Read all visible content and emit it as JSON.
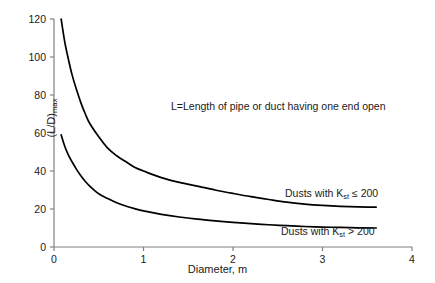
{
  "chart_data": {
    "type": "line",
    "title": "",
    "xlabel": "Diameter, m",
    "ylabel": "(L/D)max",
    "ylabel_base": "(L/D)",
    "ylabel_sub": "max",
    "xlim": [
      0,
      4
    ],
    "ylim": [
      0,
      120
    ],
    "xticks": [
      0,
      1,
      2,
      3,
      4
    ],
    "yticks": [
      0,
      20,
      40,
      60,
      80,
      100,
      120
    ],
    "xtick_labels": [
      "0",
      "1",
      "2",
      "3",
      "4"
    ],
    "ytick_labels": [
      "0",
      "20",
      "40",
      "60",
      "80",
      "100",
      "120"
    ],
    "grid": false,
    "legend_position": "inline-right-of-curve",
    "annotations": [
      {
        "name": "definition-note",
        "text": "L=Length of pipe or duct having one end open",
        "x": 1.35,
        "y": 72
      }
    ],
    "series": [
      {
        "name": "Dusts with Kst <= 200",
        "label_prefix": "Dusts with K",
        "label_sub": "st",
        "label_suffix": " ≤ 200",
        "color": "#000000",
        "x": [
          0.08,
          0.12,
          0.16,
          0.2,
          0.25,
          0.3,
          0.35,
          0.4,
          0.5,
          0.6,
          0.7,
          0.8,
          0.9,
          1.0,
          1.2,
          1.4,
          1.6,
          1.8,
          2.0,
          2.2,
          2.4,
          2.6,
          2.8,
          3.0,
          3.2,
          3.4,
          3.6
        ],
        "y": [
          120,
          108,
          99,
          91,
          83,
          76,
          70,
          65,
          58,
          52,
          48,
          45,
          42,
          40,
          36.5,
          34,
          32,
          30,
          28.2,
          26.5,
          25,
          23.6,
          22.6,
          21.9,
          21.4,
          21.1,
          21.0
        ]
      },
      {
        "name": "Dusts with Kst > 200",
        "label_prefix": "Dusts with K",
        "label_sub": "st",
        "label_suffix": " > 200",
        "color": "#000000",
        "x": [
          0.08,
          0.12,
          0.16,
          0.2,
          0.25,
          0.3,
          0.35,
          0.4,
          0.5,
          0.6,
          0.7,
          0.8,
          0.9,
          1.0,
          1.2,
          1.4,
          1.6,
          1.8,
          2.0,
          2.2,
          2.4,
          2.6,
          2.8,
          3.0,
          3.2,
          3.4,
          3.6
        ],
        "y": [
          59,
          53,
          48.5,
          45,
          41,
          37.5,
          34.5,
          32,
          28,
          25.5,
          23.3,
          21.6,
          20.2,
          19.0,
          17.2,
          15.8,
          14.7,
          13.8,
          13.0,
          12.3,
          11.7,
          11.2,
          10.8,
          10.5,
          10.3,
          10.1,
          10.0
        ]
      }
    ],
    "axis_color": "#808080",
    "curve_color": "#000000",
    "background_color": "#ffffff"
  }
}
